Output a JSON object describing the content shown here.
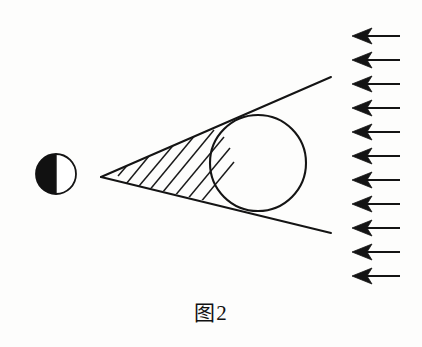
{
  "figure": {
    "caption": "图2",
    "caption_position": {
      "x": 211,
      "y": 310
    },
    "background_color": "#fdfdfc",
    "stroke_color": "#141414",
    "fill_color": "#111111",
    "title": "图2"
  },
  "diagram": {
    "type": "optics-shadow-diagram",
    "elements": {
      "source_circle": {
        "name": "half-shaded-circle",
        "center": {
          "x": 56,
          "y": 174
        },
        "radius": 20,
        "shading": "left-half-filled",
        "fill_color": "#111111",
        "stroke_color": "#141414",
        "stroke_width": 1.6
      },
      "apex": {
        "name": "cone-apex",
        "x": 101,
        "y": 177
      },
      "tangent_lines": [
        {
          "name": "upper-tangent-line",
          "x1": 101,
          "y1": 177,
          "x2": 331,
          "y2": 77,
          "stroke_width": 1.9
        },
        {
          "name": "lower-tangent-line",
          "x1": 101,
          "y1": 177,
          "x2": 331,
          "y2": 233,
          "stroke_width": 1.9
        }
      ],
      "target_circle": {
        "name": "large-circle",
        "center": {
          "x": 258,
          "y": 163
        },
        "radius": 48,
        "fill": "none",
        "stroke_color": "#141414",
        "stroke_width": 2.0
      },
      "hatching": {
        "name": "hatched-wedge-region",
        "line_count": 8,
        "direction": "lower-left-to-upper-right",
        "stroke_width": 1.5,
        "lines": [
          {
            "x1": 118,
            "y1": 176,
            "x2": 131,
            "y2": 161
          },
          {
            "x1": 126,
            "y1": 182,
            "x2": 152,
            "y2": 152
          },
          {
            "x1": 134,
            "y1": 188,
            "x2": 172,
            "y2": 144
          },
          {
            "x1": 143,
            "y1": 193,
            "x2": 191,
            "y2": 137
          },
          {
            "x1": 152,
            "y1": 198,
            "x2": 206,
            "y2": 134
          },
          {
            "x1": 162,
            "y1": 202,
            "x2": 214,
            "y2": 141
          },
          {
            "x1": 172,
            "y1": 206,
            "x2": 220,
            "y2": 150
          },
          {
            "x1": 183,
            "y1": 208,
            "x2": 224,
            "y2": 160
          }
        ]
      },
      "arrows": {
        "name": "incoming-ray-arrows",
        "count": 11,
        "direction": "left",
        "tail_x_start": 400,
        "head_x": 352,
        "first_y": 36,
        "spacing": 24,
        "stroke_width": 1.8,
        "y_values": [
          36,
          60,
          84,
          108,
          132,
          156,
          180,
          204,
          228,
          252,
          276
        ]
      }
    }
  }
}
